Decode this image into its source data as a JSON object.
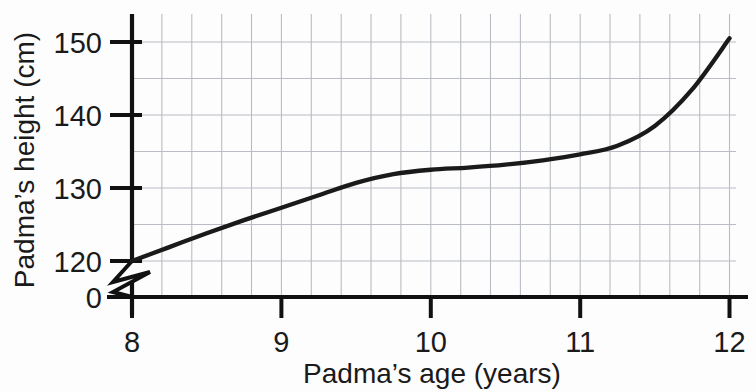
{
  "chart_data": {
    "type": "line",
    "title": "",
    "xlabel": "Padma’s age (years)",
    "ylabel": "Padma’s height (cm)",
    "x": [
      8,
      8.25,
      8.5,
      8.75,
      9,
      9.25,
      9.5,
      9.75,
      10,
      10.25,
      10.5,
      10.75,
      11,
      11.25,
      11.5,
      11.75,
      12
    ],
    "values": [
      120,
      121.9,
      123.8,
      125.6,
      127.3,
      129,
      130.7,
      131.9,
      132.5,
      132.8,
      133.2,
      133.8,
      134.6,
      135.8,
      138.5,
      143.5,
      150.5
    ],
    "series": [
      {
        "name": "Padma’s height",
        "values": [
          120,
          121.9,
          123.8,
          125.6,
          127.3,
          129,
          130.7,
          131.9,
          132.5,
          132.8,
          133.2,
          133.8,
          134.6,
          135.8,
          138.5,
          143.5,
          150.5
        ]
      }
    ],
    "xlim": [
      8,
      12
    ],
    "ylim": [
      120,
      152
    ],
    "xticks": [
      8,
      9,
      10,
      11,
      12
    ],
    "xtick_labels": [
      "8",
      "9",
      "10",
      "11",
      "12"
    ],
    "yticks": [
      120,
      130,
      140,
      150
    ],
    "ytick_labels": [
      "120",
      "130",
      "140",
      "150"
    ],
    "y_origin_label": "0",
    "y_axis_break": true,
    "grid": true,
    "grid_x_step": 0.25,
    "grid_y_step": 5,
    "legend": "none",
    "line_color": "#1a1a1a",
    "grid_color": "#b9bcc2",
    "axis_color": "#111111"
  },
  "axes": {
    "x_title": "Padma’s age (years)",
    "y_title": "Padma’s height (cm)",
    "y_tick_150": "150",
    "y_tick_140": "140",
    "y_tick_130": "130",
    "y_tick_120": "120",
    "y_tick_zero": "0",
    "x_tick_8": "8",
    "x_tick_9": "9",
    "x_tick_10": "10",
    "x_tick_11": "11",
    "x_tick_12": "12"
  }
}
